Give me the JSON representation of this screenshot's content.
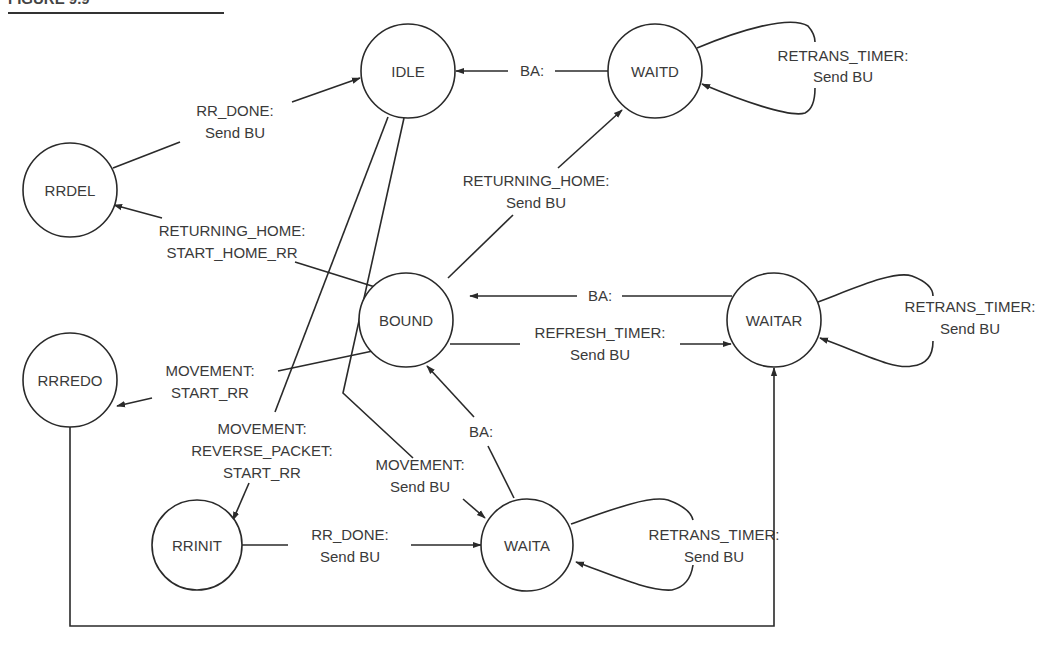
{
  "figure": {
    "title_fragment": "FIGURE 9.9"
  },
  "states": {
    "idle": "IDLE",
    "waitd": "WAITD",
    "rrdel": "RRDEL",
    "bound": "BOUND",
    "waitar": "WAITAR",
    "rrredo": "RRREDO",
    "rrinit": "RRINIT",
    "waita": "WAITA"
  },
  "transitions": {
    "waitd_to_idle": {
      "line1": "BA:"
    },
    "waitd_self": {
      "line1": "RETRANS_TIMER:",
      "line2": "Send BU"
    },
    "rrdel_to_idle": {
      "line1": "RR_DONE:",
      "line2": "Send BU"
    },
    "bound_to_rrdel": {
      "line1": "RETURNING_HOME:",
      "line2": "START_HOME_RR"
    },
    "bound_to_waitd": {
      "line1": "RETURNING_HOME:",
      "line2": "Send BU"
    },
    "waitar_to_bound": {
      "line1": "BA:"
    },
    "bound_to_waitar": {
      "line1": "REFRESH_TIMER:",
      "line2": "Send BU"
    },
    "waitar_self": {
      "line1": "RETRANS_TIMER:",
      "line2": "Send BU"
    },
    "bound_to_rrredo": {
      "line1": "MOVEMENT:",
      "line2": "START_RR"
    },
    "idle_to_rrinit": {
      "line1": "MOVEMENT:",
      "line2": "REVERSE_PACKET:",
      "line3": "START_RR"
    },
    "idle_to_waita": {
      "line1": "MOVEMENT:",
      "line2": "Send BU"
    },
    "waita_to_bound": {
      "line1": "BA:"
    },
    "rrinit_to_waita": {
      "line1": "RR_DONE:",
      "line2": "Send BU"
    },
    "waita_self": {
      "line1": "RETRANS_TIMER:",
      "line2": "Send BU"
    },
    "rrredo_to_waitar": {}
  }
}
